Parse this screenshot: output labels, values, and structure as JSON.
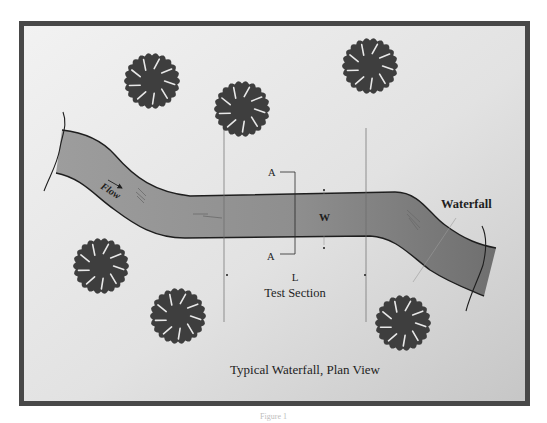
{
  "figure": {
    "title": "Typical Waterfall, Plan View",
    "footnote": "Figure 1"
  },
  "labels": {
    "flow": "Flow",
    "waterfall": "Waterfall",
    "section_marker_top": "A",
    "section_marker_bottom": "A",
    "width": "W",
    "length": "L",
    "test_section": "Test Section"
  },
  "colors": {
    "frame": "#484848",
    "background_light": "#f2f2f2",
    "background_dark": "#c6c6c6",
    "river_light": "#9d9d9d",
    "river_dark": "#6f6f6f",
    "tree": "#3e3e3e",
    "ink": "#1e1e1e"
  },
  "trees": [
    {
      "name": "tree-top-left"
    },
    {
      "name": "tree-top-center"
    },
    {
      "name": "tree-top-right"
    },
    {
      "name": "tree-bottom-far-left"
    },
    {
      "name": "tree-bottom-left"
    },
    {
      "name": "tree-bottom-right"
    }
  ]
}
